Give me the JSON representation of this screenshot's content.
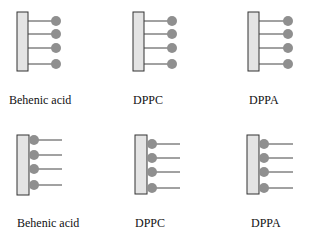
{
  "diagram": {
    "colors": {
      "substrate_fill": "#e4e4e4",
      "substrate_stroke": "#333333",
      "head": "#8f8f8f",
      "tail": "#444444"
    },
    "top_row": {
      "orientation": "tails-toward-substrate",
      "panels": [
        {
          "label": "Behenic acid",
          "x": 17
        },
        {
          "label": "DPPC",
          "x": 133
        },
        {
          "label": "DPPA",
          "x": 248
        }
      ]
    },
    "bottom_row": {
      "orientation": "heads-toward-substrate",
      "panels": [
        {
          "label": "Behenic acid",
          "x": 17
        },
        {
          "label": "DPPC",
          "x": 135
        },
        {
          "label": "DPPA",
          "x": 247
        }
      ]
    }
  }
}
